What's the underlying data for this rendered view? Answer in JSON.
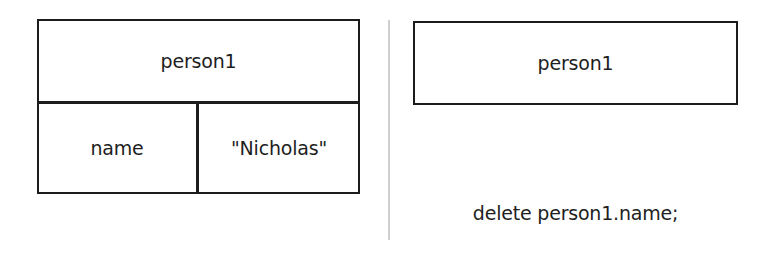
{
  "left_panel": {
    "object_label": "person1",
    "properties": [
      {
        "key": "name",
        "value": "\"Nicholas\""
      }
    ]
  },
  "right_panel": {
    "object_label": "person1",
    "code": "delete person1.name;"
  },
  "colors": {
    "stroke": "#1c1c1c",
    "text": "#1e1e1e",
    "divider": "#cfcfcf",
    "background": "#ffffff"
  }
}
